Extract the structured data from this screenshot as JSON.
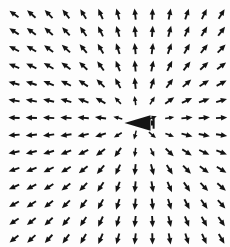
{
  "figure": {
    "title": "",
    "background_color": "#fdfdfd",
    "arrow_color": "#141414",
    "width": 230,
    "height": 247
  },
  "chart_data": {
    "type": "scatter",
    "plot_kind": "quiver",
    "title": "",
    "subtitle": "",
    "xlabel": "",
    "ylabel": "",
    "xlim": [
      0,
      230
    ],
    "ylim": [
      0,
      247
    ],
    "grid": false,
    "legend": null,
    "axes_visible": false,
    "tick_labels_x": [],
    "tick_labels_y": [],
    "annotations": [],
    "singularity": {
      "x": 138,
      "y": 123,
      "marker": "large-left-arrowhead",
      "marker_size": 26,
      "direction_deg": 180
    },
    "grid_spec": {
      "x_start": 14,
      "y_start": 14,
      "dx": 17.3,
      "dy": 17.3,
      "n_cols": 13,
      "n_rows": 14
    },
    "arrow_style": {
      "shaft_length": 9,
      "head_length": 5,
      "head_width": 4.4,
      "line_width": 1.5
    },
    "field_model": {
      "name": "source-plus-uniform-flow",
      "source_strength": 1.0,
      "uniform_u": -0.42,
      "uniform_v": 0.0,
      "note": "u = -0.42 + k*(x-x0)/r^2, v = k*(y-y0)/r^2 evaluated on the grid"
    }
  }
}
